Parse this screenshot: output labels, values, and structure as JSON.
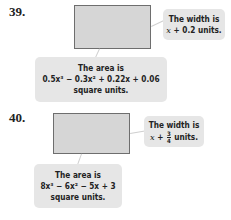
{
  "problems": [
    {
      "number": "39.",
      "width_callout": {
        "line1": "The width is",
        "expr_var": "x",
        "expr_rest": " + 0.2 units."
      },
      "area_callout": {
        "line1": "The area is",
        "expr": "0.5x³ − 0.3x² + 0.22x + 0.06",
        "line3": "square units."
      }
    },
    {
      "number": "40.",
      "width_callout": {
        "line1": "The width is",
        "expr_var": "x",
        "expr_plus": " + ",
        "frac_num": "3",
        "frac_den": "4",
        "expr_rest": " units."
      },
      "area_callout": {
        "line1": "The area is",
        "expr": "8x³ − 6x² − 5x + 3",
        "line3": "square units."
      }
    }
  ],
  "colors": {
    "rect_fill": "#d6d6d6",
    "rect_border": "#6e6e6e",
    "callout_fill": "#e6e6e6"
  }
}
